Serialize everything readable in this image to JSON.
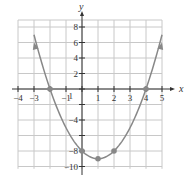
{
  "chart_data": {
    "type": "line",
    "title": "",
    "function": "y = x^2 - 2x - 8",
    "xlabel": "x",
    "ylabel": "y",
    "xlim": [
      -4,
      5
    ],
    "ylim": [
      -10,
      8
    ],
    "x_ticks": [
      -4,
      -3,
      -1,
      1,
      2,
      3,
      4,
      5
    ],
    "x_tick_labels": [
      "−4",
      "−3",
      "−1",
      "1",
      "2",
      "3",
      "4",
      "5"
    ],
    "y_ticks": [
      8,
      6,
      4,
      2,
      -4,
      -8,
      -10
    ],
    "y_tick_labels": [
      "8",
      "6",
      "4",
      "2",
      "−4",
      "−8",
      "−10"
    ],
    "extra_labels": [
      {
        "text": "1",
        "x": -0.7,
        "y": -0.9
      }
    ],
    "grid": true,
    "points": [
      {
        "x": -3,
        "y": 6,
        "marker": "arrow"
      },
      {
        "x": -2,
        "y": 0,
        "marker": "dot"
      },
      {
        "x": 0,
        "y": -8,
        "marker": "dot"
      },
      {
        "x": 1,
        "y": -9,
        "marker": "dot"
      },
      {
        "x": 2,
        "y": -8,
        "marker": "dot"
      },
      {
        "x": 4,
        "y": 0,
        "marker": "dot"
      },
      {
        "x": 5,
        "y": 6,
        "marker": "arrow"
      }
    ],
    "colors": {
      "curve": "#888888",
      "grid": "#c8c8c8",
      "axis": "#333333"
    }
  }
}
